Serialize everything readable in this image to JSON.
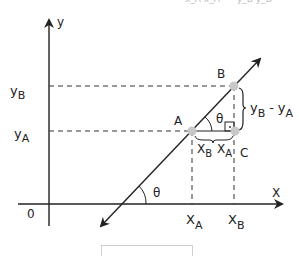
{
  "diagram": {
    "title_cut": "x_A x_A      y_B y_B",
    "axes": {
      "x_label": "X",
      "y_label": "y",
      "origin_label": "0"
    },
    "points": {
      "A": "A",
      "B": "B",
      "C": "C"
    },
    "x_ticks": {
      "xA_main": "X",
      "xA_sub": "A",
      "xB_main": "X",
      "xB_sub": "B"
    },
    "y_ticks": {
      "yA_main": "y",
      "yA_sub": "A",
      "yB_main": "y",
      "yB_sub": "B"
    },
    "angle_label_top": "θ",
    "angle_label_bottom": "θ",
    "horizontal_diff": {
      "left_main": "X",
      "left_sub": "B",
      "right_main": "X",
      "right_sub": "A"
    },
    "vertical_diff": {
      "main1": "y",
      "sub1": "B",
      "minus": "-",
      "main2": "y",
      "sub2": "A"
    },
    "colors": {
      "line": "#222222",
      "point": "#c8c8c8",
      "dashed": "#333333"
    }
  }
}
